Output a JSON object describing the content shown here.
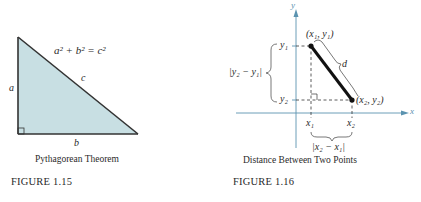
{
  "figures": [
    {
      "id": "fig1",
      "label": "FIGURE  1.15",
      "caption": "Pythagorean Theorem",
      "equation": "a² + b² = c²",
      "side_labels": {
        "a": "a",
        "b": "b",
        "c": "c"
      },
      "fill_color": "#c8dfe3"
    },
    {
      "id": "fig2",
      "label": "FIGURE  1.16",
      "caption": "Distance Between Two Points",
      "axis_labels": {
        "x": "x",
        "y": "y"
      },
      "point1": "(x₁, y₁)",
      "point2": "(x₂, y₂)",
      "tick_labels": {
        "x1": "x₁",
        "x2": "x₂",
        "y1": "y₁",
        "y2": "y₂"
      },
      "distance_label": "d",
      "vertical_diff": "|y₂ − y₁|",
      "horizontal_diff": "|x₂ − x₁|",
      "axis_color": "#5b93b0"
    }
  ]
}
